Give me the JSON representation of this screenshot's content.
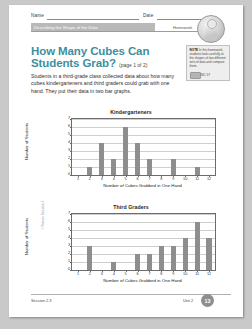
{
  "header": {
    "name_label": "Name",
    "date_label": "Date",
    "unit_banner": "Describing the Shape of the Data",
    "homework_label": "Homework",
    "badge_icon": "student-portrait-icon"
  },
  "title": {
    "main": "How Many Cubes Can Students Grab?",
    "page_of": "(page 1 of 2)"
  },
  "body": {
    "paragraph": "Students in a third-grade class collected data about how many cubes kindergarteners and third graders could grab with one hand. They put their data in two bar graphs."
  },
  "note": {
    "label": "NOTE",
    "text": "In this homework, students look carefully at the shapes of two different sets of data and compare them.",
    "standard": "NC 57",
    "chip_icon": "workbook-chip-icon"
  },
  "footer": {
    "session": "Session 2.3",
    "unit": "Unit 2",
    "page_number": "13",
    "side_credit": "© Pearson Education 3"
  },
  "chart_data": [
    {
      "type": "bar",
      "title": "Kindergarteners",
      "xlabel": "Number of Cubes Grabbed in One Hand",
      "ylabel": "Number of Students",
      "categories": [
        1,
        2,
        3,
        4,
        5,
        6,
        7,
        8,
        9,
        10,
        11,
        12
      ],
      "values": [
        0,
        1,
        4,
        2,
        6,
        4,
        2,
        0,
        2,
        0,
        1,
        0
      ],
      "ylim": [
        0,
        7
      ],
      "yticks": [
        0,
        1,
        2,
        3,
        4,
        5,
        6,
        7
      ],
      "grid": true,
      "legend": "none",
      "bar_color": "#8e8e8e"
    },
    {
      "type": "bar",
      "title": "Third Graders",
      "xlabel": "Number of Cubes Grabbed in One Hand",
      "ylabel": "Number of Students",
      "categories": [
        1,
        2,
        3,
        4,
        5,
        6,
        7,
        8,
        9,
        10,
        11,
        12
      ],
      "values": [
        0,
        3,
        0,
        1,
        0,
        2,
        2,
        3,
        3,
        4,
        6,
        4
      ],
      "ylim": [
        0,
        7
      ],
      "yticks": [
        0,
        1,
        2,
        3,
        4,
        5,
        6,
        7
      ],
      "grid": true,
      "legend": "none",
      "bar_color": "#8e8e8e"
    }
  ]
}
